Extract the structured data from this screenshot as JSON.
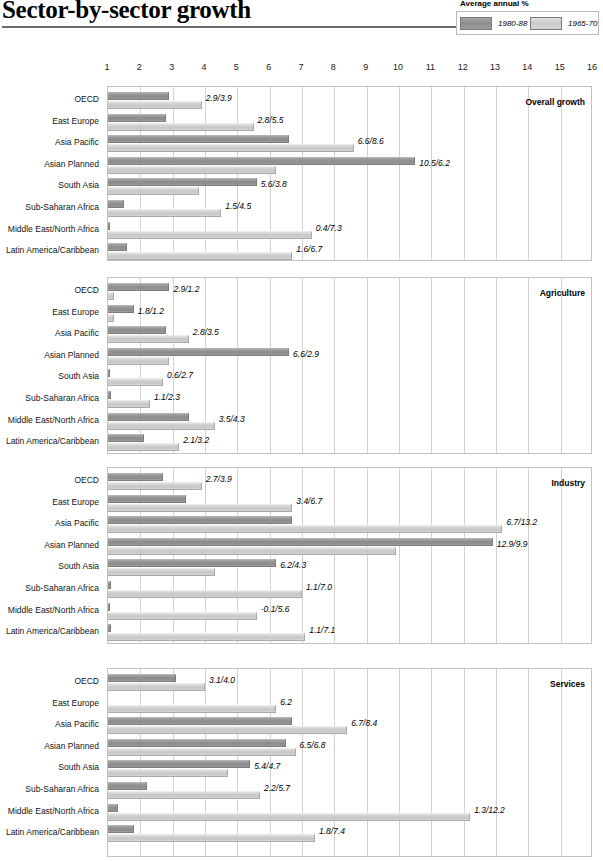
{
  "title": "Sector-by-sector growth",
  "legend": {
    "caption": "Average annual %",
    "entries": [
      {
        "label": "1980-88",
        "swatch": "dark",
        "color": "#949494"
      },
      {
        "label": "1965-70",
        "swatch": "light",
        "color": "#cdcdcd"
      }
    ]
  },
  "axis": {
    "ticks": [
      "1",
      "2",
      "3",
      "4",
      "5",
      "6",
      "7",
      "8",
      "9",
      "10",
      "11",
      "12",
      "13",
      "14",
      "15",
      "16"
    ],
    "min": 1,
    "max": 16
  },
  "regions": [
    "OECD",
    "East Europe",
    "Asia Pacific",
    "Asian Planned",
    "South Asia",
    "Sub-Saharan Africa",
    "Middle East/North Africa",
    "Latin America/Caribbean"
  ],
  "chart_data": {
    "type": "bar",
    "title": "Sector-by-sector growth",
    "xlabel": "Average annual %",
    "ylabel": "",
    "xlim": [
      1,
      16
    ],
    "grid": true,
    "legend_position": "top-right",
    "orientation": "horizontal",
    "categories": [
      "OECD",
      "East Europe",
      "Asia Pacific",
      "Asian Planned",
      "South Asia",
      "Sub-Saharan Africa",
      "Middle East/North Africa",
      "Latin America/Caribbean"
    ],
    "panels": [
      {
        "name": "Overall growth",
        "series": [
          {
            "name": "1980-88",
            "values": [
              2.9,
              2.8,
              6.6,
              10.5,
              5.6,
              1.5,
              0.4,
              1.6
            ]
          },
          {
            "name": "1965-70",
            "values": [
              3.9,
              5.5,
              8.6,
              6.2,
              3.8,
              4.5,
              7.3,
              6.7
            ]
          }
        ],
        "labels": [
          "2.9/3.9",
          "2.8/5.5",
          "6.6/8.6",
          "10.5/6.2",
          "5.6/3.8",
          "1.5/4.5",
          "0.4/7.3",
          "1.6/6.7"
        ]
      },
      {
        "name": "Agriculture",
        "series": [
          {
            "name": "1980-88",
            "values": [
              2.9,
              1.8,
              2.8,
              6.6,
              0.6,
              1.1,
              3.5,
              2.1
            ]
          },
          {
            "name": "1965-70",
            "values": [
              1.2,
              1.2,
              3.5,
              2.9,
              2.7,
              2.3,
              4.3,
              3.2
            ]
          }
        ],
        "labels": [
          "2.9/1.2",
          "1.8/1.2",
          "2.8/3.5",
          "6.6/2.9",
          "0.6/2.7",
          "1.1/2.3",
          "3.5/4.3",
          "2.1/3.2"
        ]
      },
      {
        "name": "Industry",
        "series": [
          {
            "name": "1980-88",
            "values": [
              2.7,
              3.4,
              6.7,
              12.9,
              6.2,
              1.1,
              -0.1,
              1.1
            ]
          },
          {
            "name": "1965-70",
            "values": [
              3.9,
              6.7,
              13.2,
              9.9,
              4.3,
              7.0,
              5.6,
              7.1
            ]
          }
        ],
        "labels": [
          "2.7/3.9",
          "3.4/6.7",
          "6.7/13.2",
          "12.9/9.9",
          "6.2/4.3",
          "1.1/7.0",
          "-0.1/5.6",
          "1.1/7.1"
        ]
      },
      {
        "name": "Services",
        "series": [
          {
            "name": "1980-88",
            "values": [
              3.1,
              null,
              6.7,
              6.5,
              5.4,
              2.2,
              1.3,
              1.8
            ]
          },
          {
            "name": "1965-70",
            "values": [
              4.0,
              6.2,
              8.4,
              6.8,
              4.7,
              5.7,
              12.2,
              7.4
            ]
          }
        ],
        "labels": [
          "3.1/4.0",
          "6.2",
          "6.7/8.4",
          "6.5/6.8",
          "5.4/4.7",
          "2.2/5.7",
          "1.3/12.2",
          "1.8/7.4"
        ]
      }
    ]
  }
}
